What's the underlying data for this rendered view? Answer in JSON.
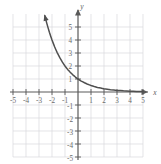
{
  "figure": {
    "title_fragment": "",
    "background_color": "#ffffff",
    "grid_color": "#d8d8dc",
    "axis_color": "#5a5a5a",
    "curve_color": "#4f4f4f",
    "label_color": "#6a6a6a"
  },
  "chart_data": {
    "type": "line",
    "title": "",
    "subtitle": "",
    "xlabel": "x",
    "ylabel": "y",
    "xlim": [
      -5.5,
      5.5
    ],
    "ylim": [
      -5.5,
      5.8
    ],
    "grid": true,
    "legend": "none",
    "x_ticks": [
      -5,
      -4,
      -3,
      -2,
      -1,
      1,
      2,
      3,
      4,
      5
    ],
    "y_ticks": [
      5,
      4,
      3,
      2,
      1,
      -1,
      -2,
      -3,
      -4,
      -5
    ],
    "x_tick_labels": [
      "-5",
      "-4",
      "-3",
      "-2",
      "-1",
      "1",
      "2",
      "3",
      "4",
      "5"
    ],
    "y_tick_labels": [
      "5",
      "4",
      "3",
      "2",
      "1",
      "-1",
      "-2",
      "-3",
      "-4",
      "-5"
    ],
    "series": [
      {
        "name": "y = 2^(-x)",
        "equation": "y = 2^(-x)",
        "arrow_start": true,
        "arrow_end": false,
        "x": [
          -2.55,
          -2.4,
          -2.2,
          -2.0,
          -1.8,
          -1.6,
          -1.4,
          -1.2,
          -1.0,
          -0.8,
          -0.6,
          -0.4,
          -0.2,
          0.0,
          0.25,
          0.5,
          0.75,
          1.0,
          1.25,
          1.5,
          1.75,
          2.0,
          2.5,
          3.0,
          3.5,
          4.0,
          4.5,
          5.0
        ],
        "y": [
          5.86,
          5.28,
          4.59,
          4.0,
          3.48,
          3.03,
          2.64,
          2.3,
          2.0,
          1.74,
          1.52,
          1.32,
          1.15,
          1.0,
          0.84,
          0.71,
          0.59,
          0.5,
          0.42,
          0.35,
          0.3,
          0.25,
          0.18,
          0.125,
          0.088,
          0.063,
          0.044,
          0.031
        ]
      }
    ],
    "key_points": [
      {
        "x": -2,
        "y": 4
      },
      {
        "x": -1,
        "y": 2
      },
      {
        "x": 0,
        "y": 1
      },
      {
        "x": 1,
        "y": 0.5
      },
      {
        "x": 2,
        "y": 0.25
      }
    ],
    "asymptote": {
      "type": "horizontal",
      "value": 0
    }
  }
}
